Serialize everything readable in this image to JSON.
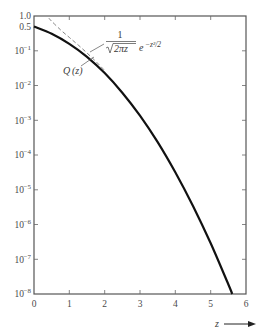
{
  "chart_data": {
    "type": "line",
    "title": "",
    "xlabel": "z",
    "ylabel": "",
    "xscale": "linear",
    "yscale": "log",
    "xlim": [
      0,
      6
    ],
    "ylim": [
      1e-08,
      1.0
    ],
    "grid": false,
    "legend": null,
    "x_ticks": [
      "0",
      "1",
      "2",
      "3",
      "4",
      "5",
      "6"
    ],
    "y_ticks": [
      "1.0",
      "0.5",
      "10^-1",
      "10^-2",
      "10^-3",
      "10^-4",
      "10^-5",
      "10^-6",
      "10^-7",
      "10^-8"
    ],
    "series": [
      {
        "name": "Q(z)",
        "style": "solid-thick",
        "x": [
          0,
          0.5,
          1,
          1.5,
          2,
          2.5,
          3,
          3.5,
          4,
          4.5,
          5,
          5.5,
          5.61
        ],
        "values": [
          0.5,
          0.3085,
          0.1587,
          0.0668,
          0.02275,
          0.00621,
          0.00135,
          0.000233,
          3.17e-05,
          3.4e-06,
          2.87e-07,
          1.9e-08,
          1e-08
        ]
      },
      {
        "name": "1/(sqrt(2*pi)*z) * e^(-z^2/2)",
        "style": "dashed",
        "x": [
          0.42,
          0.5,
          0.75,
          1,
          1.25,
          1.5,
          1.75,
          2
        ],
        "values": [
          0.87,
          0.704,
          0.401,
          0.242,
          0.146,
          0.0863,
          0.0493,
          0.027
        ]
      }
    ],
    "annotations": [
      {
        "text": "Q(z)",
        "points_to": "solid curve near z≈1.6"
      },
      {
        "text": "1/√(2πz) e^(−z²/2)",
        "points_to": "dashed curve near z≈1.6"
      }
    ]
  },
  "labels": {
    "x0": "0",
    "x1": "1",
    "x2": "2",
    "x3": "3",
    "x4": "4",
    "x5": "5",
    "x6": "6",
    "y_1_0": "1.0",
    "y_0_5": "0.5",
    "y_base": "10",
    "e1": "−1",
    "e2": "−2",
    "e3": "−3",
    "e4": "−4",
    "e5": "−5",
    "e6": "−6",
    "e7": "−7",
    "e8": "−8",
    "xlabel": "z",
    "q_label": "Q",
    "q_arg": "(z)",
    "formula_num": "1",
    "formula_den": "2πz",
    "formula_e": "e",
    "formula_exp": "−z²/2"
  }
}
